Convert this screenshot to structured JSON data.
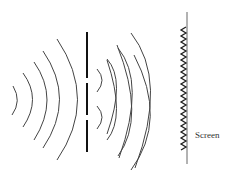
{
  "diagram": {
    "screen_label": "Screen",
    "colors": {
      "background": "#ffffff",
      "wave": "#444444",
      "barrier": "#111111",
      "screen": "#666666",
      "pattern": "#222222"
    },
    "elements": {
      "incident_waves": {
        "count": 5,
        "direction": "left-to-right"
      },
      "barrier": {
        "slits": 2
      },
      "diffracted_waves": {
        "sources": 2,
        "arcs_per_source": 3
      },
      "interference_pattern": {
        "type": "wavy",
        "on": "screen"
      }
    }
  }
}
